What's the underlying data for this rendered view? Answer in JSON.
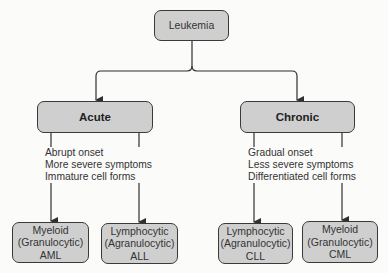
{
  "root": {
    "label": "Leukemia"
  },
  "categories": [
    {
      "label": "Acute",
      "characteristics": [
        "Abrupt onset",
        "More severe symptoms",
        "Immature cell forms"
      ],
      "subtypes": [
        {
          "line1": "Myeloid",
          "line2": "(Granulocytic)",
          "abbr": "AML"
        },
        {
          "line1": "Lymphocytic",
          "line2": "(Agranulocytic)",
          "abbr": "ALL"
        }
      ]
    },
    {
      "label": "Chronic",
      "characteristics": [
        "Gradual onset",
        "Less severe symptoms",
        "Differentiated cell forms"
      ],
      "subtypes": [
        {
          "line1": "Lymphocytic",
          "line2": "(Agranulocytic)",
          "abbr": "CLL"
        },
        {
          "line1": "Myeloid",
          "line2": "(Granulocytic)",
          "abbr": "CML"
        }
      ]
    }
  ],
  "colors": {
    "node_fill": "#cfcfcf",
    "node_border": "#3a3a3a",
    "line": "#2f2f2f",
    "background": "#fbfbfa"
  }
}
